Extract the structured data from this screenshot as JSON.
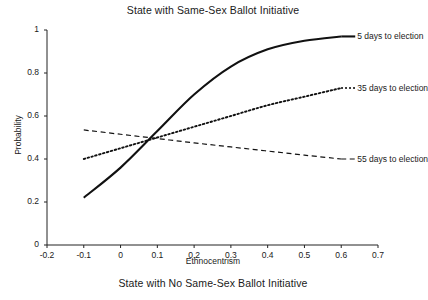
{
  "chart_data": {
    "type": "line",
    "title": "State with Same-Sex Ballot Initiative",
    "caption": "State with No Same-Sex Ballot Initiative",
    "xlabel": "Ethnocentrism",
    "ylabel": "Probability",
    "xlim": [
      -0.2,
      0.7
    ],
    "ylim": [
      0,
      1
    ],
    "grid": false,
    "legend_position": "right-inline-annotations",
    "xticks": [
      "-0.2",
      "-0.1",
      "0",
      "0.1",
      "0.2",
      "0.3",
      "0.4",
      "0.5",
      "0.6",
      "0.7"
    ],
    "xtick_values": [
      -0.2,
      -0.1,
      0,
      0.1,
      0.2,
      0.3,
      0.4,
      0.5,
      0.6,
      0.7
    ],
    "yticks": [
      "0",
      "0.2",
      "0.4",
      "0.6",
      "0.8",
      "1"
    ],
    "ytick_values": [
      0,
      0.2,
      0.4,
      0.6,
      0.8,
      1
    ],
    "x": [
      -0.1,
      0.0,
      0.1,
      0.2,
      0.3,
      0.4,
      0.5,
      0.6
    ],
    "series": [
      {
        "name": "5 days to election",
        "style": "solid",
        "color": "#111111",
        "values": [
          0.22,
          0.36,
          0.53,
          0.7,
          0.83,
          0.91,
          0.95,
          0.97
        ],
        "label_x": 0.6,
        "label_y": 0.97
      },
      {
        "name": "35 days to election",
        "style": "dotted",
        "color": "#111111",
        "values": [
          0.4,
          0.45,
          0.5,
          0.55,
          0.6,
          0.65,
          0.69,
          0.73
        ],
        "label_x": 0.6,
        "label_y": 0.73
      },
      {
        "name": "55 days to election",
        "style": "dashed",
        "color": "#111111",
        "values": [
          0.535,
          0.515,
          0.495,
          0.475,
          0.456,
          0.437,
          0.418,
          0.4
        ],
        "label_x": 0.6,
        "label_y": 0.4
      }
    ]
  }
}
